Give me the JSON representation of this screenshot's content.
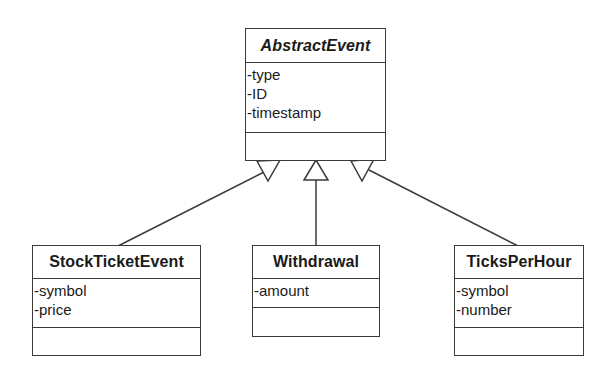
{
  "diagram": {
    "type": "uml-class-inheritance",
    "classes": [
      {
        "id": "abstract",
        "name": "AbstractEvent",
        "abstract": true,
        "attributes": [
          "-type",
          "-ID",
          "-timestamp"
        ],
        "operations": []
      },
      {
        "id": "stock",
        "name": "StockTicketEvent",
        "abstract": false,
        "attributes": [
          "-symbol",
          "-price"
        ],
        "operations": []
      },
      {
        "id": "withdrawal",
        "name": "Withdrawal",
        "abstract": false,
        "attributes": [
          "-amount"
        ],
        "operations": []
      },
      {
        "id": "ticks",
        "name": "TicksPerHour",
        "abstract": false,
        "attributes": [
          "-symbol",
          "-number"
        ],
        "operations": []
      }
    ],
    "relationships": [
      {
        "type": "generalization",
        "from": "StockTicketEvent",
        "to": "AbstractEvent"
      },
      {
        "type": "generalization",
        "from": "Withdrawal",
        "to": "AbstractEvent"
      },
      {
        "type": "generalization",
        "from": "TicksPerHour",
        "to": "AbstractEvent"
      }
    ],
    "colors": {
      "line": "#3a3a3a",
      "background": "#ffffff",
      "text": "#1a1a1a"
    }
  }
}
